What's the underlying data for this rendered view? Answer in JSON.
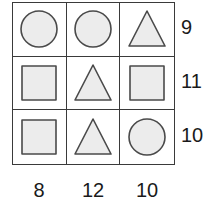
{
  "puzzle": {
    "grid": {
      "rows": 3,
      "cols": 3,
      "cells": [
        [
          {
            "shape": "circle",
            "label": "circle"
          },
          {
            "shape": "circle",
            "label": "circle"
          },
          {
            "shape": "triangle",
            "label": "triangle"
          }
        ],
        [
          {
            "shape": "square",
            "label": "square"
          },
          {
            "shape": "triangle",
            "label": "triangle"
          },
          {
            "shape": "square",
            "label": "square"
          }
        ],
        [
          {
            "shape": "square",
            "label": "square"
          },
          {
            "shape": "triangle",
            "label": "triangle"
          },
          {
            "shape": "circle",
            "label": "circle"
          }
        ]
      ]
    },
    "row_totals": [
      "9",
      "11",
      "10"
    ],
    "col_totals": [
      "8",
      "12",
      "10"
    ],
    "colors": {
      "shape_fill": "#ececec",
      "shape_stroke": "#4a4a4a",
      "grid_line": "#3a3a3a",
      "cell_background": "#ffffff",
      "label_text": "#1a1a1a",
      "page_background": "#ffffff"
    }
  },
  "chart_data": {
    "type": "table",
    "title": "",
    "xlabel": "",
    "ylabel": "",
    "categories": [
      "column-1",
      "column-2",
      "column-3"
    ],
    "row_categories": [
      "row-1",
      "row-2",
      "row-3"
    ],
    "cells": [
      [
        "circle",
        "circle",
        "triangle"
      ],
      [
        "square",
        "triangle",
        "square"
      ],
      [
        "square",
        "triangle",
        "circle"
      ]
    ],
    "row_totals": [
      9,
      11,
      10
    ],
    "col_totals": [
      8,
      12,
      10
    ],
    "legend": [],
    "grid": true
  }
}
